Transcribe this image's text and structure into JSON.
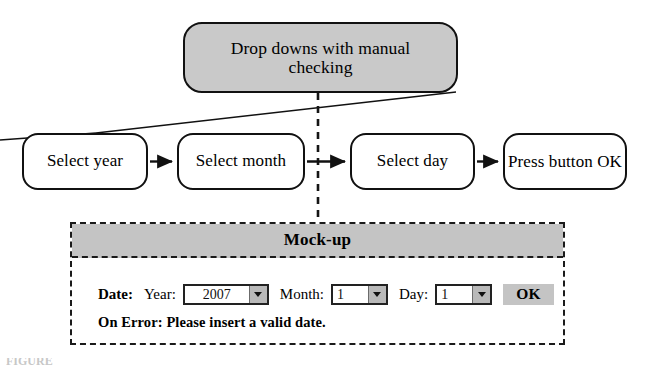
{
  "diagram": {
    "top_node": {
      "label": "Drop downs with manual checking"
    },
    "flow_nodes": [
      {
        "id": "year",
        "label": "Select year"
      },
      {
        "id": "month",
        "label": "Select month"
      },
      {
        "id": "day",
        "label": "Select day"
      },
      {
        "id": "ok",
        "label": "Press button OK"
      }
    ],
    "colors": {
      "node_fill": "#ffffff",
      "top_node_fill": "#c9c9c9",
      "header_fill": "#c4c4c4",
      "button_fill": "#c4c4c4",
      "arrow_button_fill": "#b9b9b9",
      "stroke": "#111111"
    }
  },
  "mockup": {
    "title": "Mock-up",
    "form": {
      "date_label": "Date:",
      "year_label": "Year:",
      "year_value": "2007",
      "month_label": "Month:",
      "month_value": "1",
      "day_label": "Day:",
      "day_value": "1",
      "ok_label": "OK"
    },
    "error_text": "On Error: Please insert a valid date."
  },
  "caption": {
    "text": "FIGURE"
  }
}
